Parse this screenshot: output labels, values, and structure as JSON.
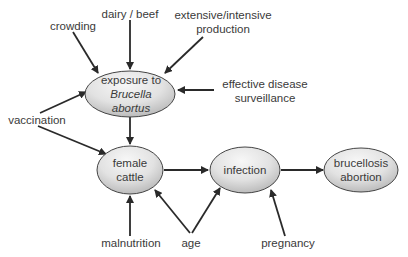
{
  "diagram": {
    "type": "causal-diagram",
    "colors": {
      "node_fill_light": "#f4f4f4",
      "node_fill_dark": "#b8b8b8",
      "stroke": "#333333",
      "text": "#3a3a3a"
    },
    "nodes": [
      {
        "id": "exposure",
        "line1": "exposure to",
        "line2": "Brucella",
        "line3": "abortus"
      },
      {
        "id": "female_cattle",
        "line1": "female",
        "line2": "cattle"
      },
      {
        "id": "infection",
        "line1": "infection"
      },
      {
        "id": "abortion",
        "line1": "brucellosis",
        "line2": "abortion"
      }
    ],
    "factors": {
      "crowding": "crowding",
      "dairy_beef": "dairy / beef",
      "production_1": "extensive/intensive",
      "production_2": "production",
      "surveillance_1": "effective disease",
      "surveillance_2": "surveillance",
      "vaccination": "vaccination",
      "malnutrition": "malnutrition",
      "age": "age",
      "pregnancy": "pregnancy"
    },
    "edges": [
      [
        "crowding",
        "exposure"
      ],
      [
        "dairy / beef",
        "exposure"
      ],
      [
        "extensive/intensive production",
        "exposure"
      ],
      [
        "effective disease surveillance",
        "exposure"
      ],
      [
        "vaccination",
        "exposure"
      ],
      [
        "vaccination",
        "female cattle"
      ],
      [
        "exposure",
        "female cattle"
      ],
      [
        "malnutrition",
        "female cattle"
      ],
      [
        "age",
        "female cattle"
      ],
      [
        "age",
        "infection"
      ],
      [
        "female cattle",
        "infection"
      ],
      [
        "pregnancy",
        "infection"
      ],
      [
        "infection",
        "brucellosis abortion"
      ]
    ]
  }
}
